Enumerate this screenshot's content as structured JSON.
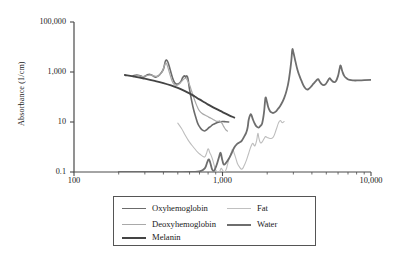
{
  "chart_data": {
    "type": "line",
    "title": "",
    "xlabel": "",
    "ylabel": "Absorbance (1/cm)",
    "xscale": "log",
    "yscale": "log",
    "xlim": [
      100,
      10000
    ],
    "ylim": [
      0.1,
      100000
    ],
    "xticks": [
      100,
      1000,
      10000
    ],
    "xtick_labels": [
      "100",
      "1,000",
      "10,000"
    ],
    "yticks": [
      0.1,
      10,
      1000,
      100000
    ],
    "ytick_labels": [
      "0.1",
      "10",
      "1,000",
      "100,000"
    ],
    "grid": false,
    "legend_position": "below-center",
    "series": [
      {
        "name": "Oxyhemoglobin",
        "color": "#6b6b6b",
        "width": 1.6,
        "points": [
          [
            250,
            700
          ],
          [
            265,
            760
          ],
          [
            280,
            700
          ],
          [
            295,
            640
          ],
          [
            310,
            760
          ],
          [
            325,
            800
          ],
          [
            340,
            700
          ],
          [
            355,
            620
          ],
          [
            370,
            700
          ],
          [
            385,
            900
          ],
          [
            400,
            1300
          ],
          [
            412,
            2600
          ],
          [
            420,
            3000
          ],
          [
            430,
            2400
          ],
          [
            445,
            1200
          ],
          [
            460,
            600
          ],
          [
            475,
            380
          ],
          [
            490,
            330
          ],
          [
            510,
            350
          ],
          [
            525,
            420
          ],
          [
            540,
            600
          ],
          [
            555,
            700
          ],
          [
            565,
            620
          ],
          [
            575,
            700
          ],
          [
            585,
            560
          ],
          [
            600,
            200
          ],
          [
            620,
            70
          ],
          [
            640,
            30
          ],
          [
            660,
            16
          ],
          [
            680,
            9
          ],
          [
            700,
            6.5
          ],
          [
            720,
            5.2
          ],
          [
            740,
            4.6
          ],
          [
            760,
            4.4
          ],
          [
            780,
            4.8
          ],
          [
            800,
            5.6
          ],
          [
            830,
            6.6
          ],
          [
            860,
            7.8
          ],
          [
            900,
            9.0
          ],
          [
            950,
            10.0
          ],
          [
            1000,
            10.4
          ],
          [
            1050,
            10.2
          ],
          [
            1100,
            10.0
          ]
        ]
      },
      {
        "name": "Deoxyhemoglobin",
        "color": "#a9a9a9",
        "width": 1.2,
        "points": [
          [
            250,
            650
          ],
          [
            270,
            720
          ],
          [
            290,
            660
          ],
          [
            310,
            720
          ],
          [
            330,
            760
          ],
          [
            350,
            680
          ],
          [
            370,
            700
          ],
          [
            390,
            950
          ],
          [
            405,
            1700
          ],
          [
            415,
            2300
          ],
          [
            425,
            1800
          ],
          [
            440,
            900
          ],
          [
            455,
            480
          ],
          [
            470,
            330
          ],
          [
            490,
            290
          ],
          [
            510,
            330
          ],
          [
            530,
            420
          ],
          [
            550,
            520
          ],
          [
            565,
            560
          ],
          [
            580,
            470
          ],
          [
            600,
            300
          ],
          [
            620,
            170
          ],
          [
            640,
            95
          ],
          [
            660,
            58
          ],
          [
            680,
            38
          ],
          [
            700,
            28
          ],
          [
            730,
            22
          ],
          [
            760,
            19
          ],
          [
            790,
            17
          ],
          [
            820,
            15
          ],
          [
            860,
            13
          ],
          [
            900,
            11
          ],
          [
            930,
            10.5
          ],
          [
            960,
            11
          ],
          [
            990,
            9
          ],
          [
            1020,
            6.5
          ],
          [
            1050,
            5.0
          ],
          [
            1080,
            4.3
          ]
        ]
      },
      {
        "name": "Melanin",
        "color": "#444444",
        "width": 1.9,
        "points": [
          [
            220,
            760
          ],
          [
            260,
            640
          ],
          [
            300,
            540
          ],
          [
            350,
            440
          ],
          [
            400,
            360
          ],
          [
            450,
            290
          ],
          [
            500,
            230
          ],
          [
            550,
            180
          ],
          [
            600,
            140
          ],
          [
            650,
            105
          ],
          [
            700,
            80
          ],
          [
            760,
            60
          ],
          [
            820,
            46
          ],
          [
            900,
            34
          ],
          [
            1000,
            25
          ],
          [
            1100,
            19
          ],
          [
            1200,
            15
          ]
        ]
      },
      {
        "name": "Fat",
        "color": "#bdbdbd",
        "width": 1.1,
        "points": [
          [
            500,
            9.0
          ],
          [
            530,
            5.5
          ],
          [
            560,
            3.0
          ],
          [
            590,
            1.8
          ],
          [
            620,
            1.2
          ],
          [
            650,
            0.85
          ],
          [
            680,
            0.62
          ],
          [
            710,
            0.5
          ],
          [
            740,
            0.42
          ],
          [
            760,
            0.4
          ],
          [
            780,
            0.55
          ],
          [
            800,
            0.85
          ],
          [
            820,
            0.6
          ],
          [
            840,
            0.45
          ],
          [
            860,
            0.3
          ],
          [
            880,
            0.18
          ],
          [
            900,
            0.12
          ],
          [
            920,
            0.105
          ],
          [
            940,
            0.1
          ],
          [
            960,
            0.11
          ],
          [
            980,
            0.14
          ],
          [
            1000,
            0.12
          ],
          [
            1030,
            0.1
          ],
          [
            1060,
            0.13
          ],
          [
            1100,
            0.3
          ],
          [
            1140,
            0.55
          ],
          [
            1170,
            0.8
          ],
          [
            1200,
            0.55
          ],
          [
            1230,
            0.35
          ],
          [
            1260,
            0.22
          ],
          [
            1300,
            0.16
          ],
          [
            1350,
            0.13
          ],
          [
            1400,
            0.18
          ],
          [
            1450,
            0.3
          ],
          [
            1500,
            0.55
          ],
          [
            1550,
            1.0
          ],
          [
            1600,
            1.4
          ],
          [
            1650,
            1.1
          ],
          [
            1700,
            1.9
          ],
          [
            1730,
            3.5
          ],
          [
            1760,
            2.2
          ],
          [
            1800,
            1.5
          ],
          [
            1850,
            1.6
          ],
          [
            1900,
            2.1
          ],
          [
            1950,
            2.6
          ],
          [
            2000,
            2.4
          ],
          [
            2100,
            2.2
          ],
          [
            2200,
            2.5
          ],
          [
            2300,
            5.0
          ],
          [
            2380,
            9.0
          ],
          [
            2450,
            11.5
          ],
          [
            2520,
            9.5
          ],
          [
            2600,
            10.5
          ]
        ]
      },
      {
        "name": "Water",
        "color": "#6e6e6e",
        "width": 1.8,
        "points": [
          [
            200,
            0.1
          ],
          [
            400,
            0.1
          ],
          [
            600,
            0.1
          ],
          [
            700,
            0.105
          ],
          [
            760,
            0.14
          ],
          [
            790,
            0.25
          ],
          [
            810,
            0.32
          ],
          [
            830,
            0.22
          ],
          [
            850,
            0.13
          ],
          [
            870,
            0.11
          ],
          [
            890,
            0.13
          ],
          [
            920,
            0.22
          ],
          [
            950,
            0.42
          ],
          [
            970,
            0.6
          ],
          [
            985,
            0.42
          ],
          [
            1000,
            0.28
          ],
          [
            1020,
            0.2
          ],
          [
            1050,
            0.22
          ],
          [
            1100,
            0.33
          ],
          [
            1150,
            0.55
          ],
          [
            1200,
            0.95
          ],
          [
            1250,
            1.3
          ],
          [
            1300,
            1.5
          ],
          [
            1350,
            1.8
          ],
          [
            1400,
            2.6
          ],
          [
            1440,
            3.6
          ],
          [
            1460,
            4.6
          ],
          [
            1480,
            6.5
          ],
          [
            1500,
            12.0
          ],
          [
            1530,
            18.0
          ],
          [
            1560,
            20.0
          ],
          [
            1600,
            13.0
          ],
          [
            1650,
            8.5
          ],
          [
            1700,
            6.5
          ],
          [
            1750,
            6.0
          ],
          [
            1800,
            7.0
          ],
          [
            1850,
            9.0
          ],
          [
            1900,
            22.0
          ],
          [
            1930,
            60.0
          ],
          [
            1950,
            95.0
          ],
          [
            1980,
            75.0
          ],
          [
            2020,
            45.0
          ],
          [
            2060,
            32.0
          ],
          [
            2100,
            26.0
          ],
          [
            2150,
            24.0
          ],
          [
            2200,
            23.0
          ],
          [
            2280,
            26.0
          ],
          [
            2350,
            32.0
          ],
          [
            2420,
            40.0
          ],
          [
            2500,
            55.0
          ],
          [
            2600,
            90.0
          ],
          [
            2700,
            180.0
          ],
          [
            2800,
            500.0
          ],
          [
            2900,
            2500.0
          ],
          [
            2950,
            7600.0
          ],
          [
            3000,
            6200.0
          ],
          [
            3100,
            2600.0
          ],
          [
            3200,
            1200.0
          ],
          [
            3300,
            700.0
          ],
          [
            3400,
            450.0
          ],
          [
            3500,
            300.0
          ],
          [
            3600,
            230.0
          ],
          [
            3700,
            200.0
          ],
          [
            3800,
            210.0
          ],
          [
            3950,
            260.0
          ],
          [
            4100,
            340.0
          ],
          [
            4250,
            430.0
          ],
          [
            4400,
            520.0
          ],
          [
            4500,
            430.0
          ],
          [
            4650,
            330.0
          ],
          [
            4800,
            300.0
          ],
          [
            4950,
            330.0
          ],
          [
            5100,
            430.0
          ],
          [
            5250,
            560.0
          ],
          [
            5400,
            480.0
          ],
          [
            5600,
            400.0
          ],
          [
            5800,
            430.0
          ],
          [
            6000,
            700.0
          ],
          [
            6150,
            1400.0
          ],
          [
            6250,
            1800.0
          ],
          [
            6400,
            1100.0
          ],
          [
            6600,
            700.0
          ],
          [
            6900,
            540.0
          ],
          [
            7200,
            480.0
          ],
          [
            7600,
            460.0
          ],
          [
            8200,
            460.0
          ],
          [
            9000,
            470.0
          ],
          [
            10000,
            480.0
          ]
        ]
      }
    ]
  },
  "legend": {
    "items": [
      {
        "label": "Oxyhemoglobin",
        "color": "#6b6b6b",
        "width": "1.8px",
        "col": 0,
        "row": 0
      },
      {
        "label": "Deoxyhemoglobin",
        "color": "#a9a9a9",
        "width": "1.3px",
        "col": 0,
        "row": 1
      },
      {
        "label": "Melanin",
        "color": "#444444",
        "width": "2px",
        "col": 0,
        "row": 2
      },
      {
        "label": "Fat",
        "color": "#c0c0c0",
        "width": "1.2px",
        "col": 1,
        "row": 0
      },
      {
        "label": "Water",
        "color": "#6e6e6e",
        "width": "2px",
        "col": 1,
        "row": 1
      }
    ]
  },
  "axes": {
    "line_color": "#4a4a4a"
  }
}
